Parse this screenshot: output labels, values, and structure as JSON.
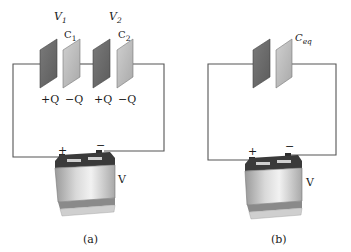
{
  "diagram": {
    "colors": {
      "wire": "#555555",
      "plate_positive": "#6e6e6e",
      "plate_negative": "#bdbdbd",
      "battery_body": "#d4d4d4",
      "battery_top": "#3a3a3a",
      "text": "#1a1a1a"
    },
    "panel_a": {
      "caption": "(a)",
      "voltage_labels": [
        {
          "symbol": "V",
          "subscript": "1"
        },
        {
          "symbol": "V",
          "subscript": "2"
        }
      ],
      "capacitors": [
        {
          "symbol": "C",
          "subscript": "1",
          "plus_charge": "+Q",
          "minus_charge": "−Q"
        },
        {
          "symbol": "C",
          "subscript": "2",
          "plus_charge": "+Q",
          "minus_charge": "−Q"
        }
      ],
      "battery": {
        "label": "V",
        "positive_terminal": "+",
        "negative_terminal": "−"
      }
    },
    "panel_b": {
      "caption": "(b)",
      "capacitor": {
        "symbol": "C",
        "subscript": "eq"
      },
      "battery": {
        "label": "V",
        "positive_terminal": "+",
        "negative_terminal": "−"
      }
    }
  }
}
